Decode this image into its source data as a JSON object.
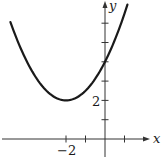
{
  "chart_data": {
    "type": "line",
    "title": "",
    "xlabel": "x",
    "ylabel": "y",
    "equation": "y = 0.5(x + 2)^2 + 2",
    "series": [
      {
        "name": "parabola",
        "x": [
          -4.85,
          -4,
          -3,
          -2,
          -1,
          0,
          1,
          1.15
        ],
        "y": [
          6.06,
          4,
          2.5,
          2,
          2.5,
          4,
          6.5,
          6.96
        ]
      }
    ],
    "vertex": [
      -2,
      2
    ],
    "y_intercept": 4,
    "xlim": [
      -5.1,
      2.2
    ],
    "ylim": [
      -0.8,
      7.2
    ],
    "x_ticks": [
      -2,
      -1,
      0,
      1
    ],
    "x_tick_labels": [
      "-2"
    ],
    "y_ticks": [
      1,
      2,
      3,
      4,
      5,
      6
    ],
    "y_tick_labels": [
      "2"
    ],
    "grid": false,
    "legend": null
  },
  "labels": {
    "x_axis": "x",
    "y_axis": "y",
    "x_tick_label": "−2",
    "y_tick_label": "2"
  },
  "colors": {
    "curve": "#1a1a1a",
    "axis": "#333333"
  }
}
